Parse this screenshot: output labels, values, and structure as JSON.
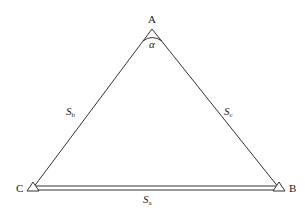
{
  "diagram": {
    "type": "triangle",
    "vertices": {
      "A": {
        "label": "A",
        "angle_label": "α"
      },
      "B": {
        "label": "B"
      },
      "C": {
        "label": "C"
      }
    },
    "sides": {
      "a": {
        "label_main": "S",
        "label_sub": "a",
        "between": [
          "B",
          "C"
        ],
        "style": "double-line"
      },
      "b": {
        "label_main": "S",
        "label_sub": "b",
        "between": [
          "A",
          "C"
        ]
      },
      "c": {
        "label_main": "S",
        "label_sub": "c",
        "between": [
          "A",
          "B"
        ]
      }
    },
    "line_color": "#333333"
  }
}
